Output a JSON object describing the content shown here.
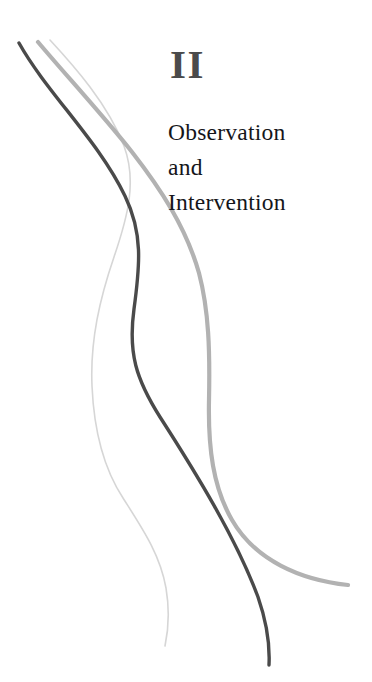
{
  "page": {
    "background_color": "#ffffff",
    "width": 372,
    "height": 682
  },
  "part": {
    "numeral": "II",
    "numeral_color": "#4b4b4b",
    "title": "Observation\nand\nIntervention",
    "title_color": "#15161a",
    "title_lines": [
      "Observation",
      "and",
      "Intervention"
    ]
  },
  "decoration": {
    "name": "three-flowing-curves",
    "curves": [
      {
        "name": "curve-dark",
        "color": "#4a4a4a",
        "width": 3.4,
        "path": "M 19 43 C 47 93, 98 140, 125 196 C 143 233, 140 265, 134 309 C 128 353, 136 379, 160 417 C 196 473, 236 538, 258 597 C 266 620, 270 645, 269 665"
      },
      {
        "name": "curve-medium-gray",
        "color": "#b2b2b2",
        "width": 4.2,
        "path": "M 38 42 C 64 73, 101 113, 132 152 C 160 188, 186 227, 199 273 C 209 311, 210 352, 209 400 C 208 448, 213 487, 232 520 C 255 560, 300 580, 348 585"
      },
      {
        "name": "curve-light-gray",
        "color": "#d6d6d6",
        "width": 1.6,
        "path": "M 50 40 C 74 66, 108 104, 124 146 C 137 181, 128 216, 114 257 C 100 298, 90 340, 92 386 C 94 432, 104 469, 123 498 C 142 528, 160 554, 166 588 C 170 612, 168 632, 165 646"
      }
    ]
  }
}
